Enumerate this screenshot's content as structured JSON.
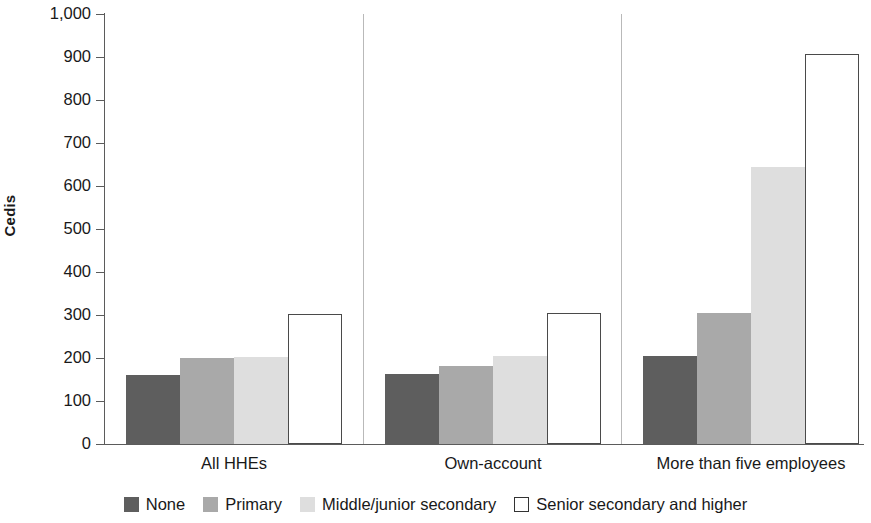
{
  "chart_data": {
    "type": "bar",
    "title": "",
    "subtitle": "",
    "xlabel": "",
    "ylabel": "Cedis",
    "categories": [
      "All HHEs",
      "Own-account",
      "More than five employees"
    ],
    "series": [
      {
        "name": "None",
        "color": "#5e5e5e",
        "values": [
          160,
          163,
          205
        ]
      },
      {
        "name": "Primary",
        "color": "#a9a9a9",
        "values": [
          200,
          182,
          305
        ]
      },
      {
        "name": "Middle/junior secondary",
        "color": "#dedede",
        "values": [
          202,
          205,
          645
        ]
      },
      {
        "name": "Senior secondary and higher",
        "color": "#ffffff",
        "values": [
          302,
          305,
          906
        ]
      }
    ],
    "ylim": [
      0,
      1000
    ],
    "ytick_values": [
      0,
      100,
      200,
      300,
      400,
      500,
      600,
      700,
      800,
      900,
      1000
    ],
    "ytick_labels": [
      "0",
      "100",
      "200",
      "300",
      "400",
      "500",
      "600",
      "700",
      "800",
      "900",
      "1,000"
    ],
    "grid": false,
    "legend_position": "bottom",
    "bar_grouping": "grouped",
    "annotations": []
  },
  "legend": {
    "items": [
      {
        "label": "None",
        "swatch": "filled-dark-gray-square"
      },
      {
        "label": "Primary",
        "swatch": "filled-medium-gray-square"
      },
      {
        "label": "Middle/junior secondary",
        "swatch": "filled-light-gray-square"
      },
      {
        "label": "Senior secondary and higher",
        "swatch": "outlined-white-square"
      }
    ]
  }
}
